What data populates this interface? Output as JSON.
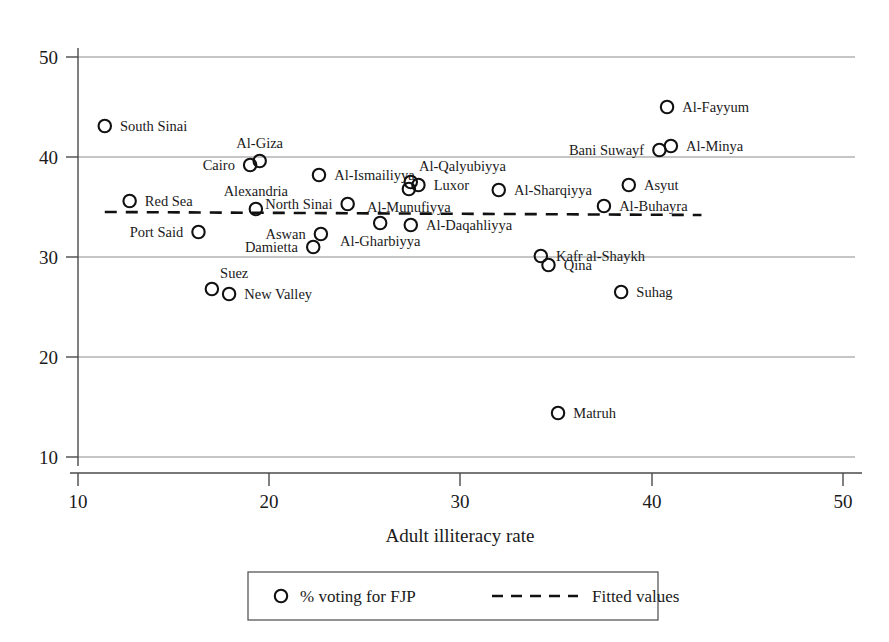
{
  "chart_data": {
    "type": "scatter",
    "title": "",
    "xlabel": "Adult illiteracy rate",
    "ylabel": "",
    "xlim": [
      10,
      50
    ],
    "ylim": [
      10,
      50
    ],
    "xticks": [
      10,
      20,
      30,
      40,
      50
    ],
    "yticks": [
      10,
      20,
      30,
      40,
      50
    ],
    "grid": true,
    "legend_position": "bottom",
    "legend": [
      {
        "label": "% voting for FJP",
        "marker": "circle"
      },
      {
        "label": "Fitted values",
        "marker": "dashed-line"
      }
    ],
    "series": [
      {
        "name": "% voting for FJP",
        "points": [
          {
            "label": "South Sinai",
            "x": 11.4,
            "y": 43.1,
            "label_pos": "right"
          },
          {
            "label": "Red Sea",
            "x": 12.7,
            "y": 35.6,
            "label_pos": "right"
          },
          {
            "label": "Port Said",
            "x": 16.3,
            "y": 32.5,
            "label_pos": "left"
          },
          {
            "label": "Suez",
            "x": 17.0,
            "y": 26.8,
            "label_pos": "above-right"
          },
          {
            "label": "New Valley",
            "x": 17.9,
            "y": 26.3,
            "label_pos": "right"
          },
          {
            "label": "Alexandria",
            "x": 19.3,
            "y": 34.8,
            "label_pos": "above"
          },
          {
            "label": "Cairo",
            "x": 19.0,
            "y": 39.2,
            "label_pos": "left"
          },
          {
            "label": "Al-Giza",
            "x": 19.5,
            "y": 39.6,
            "label_pos": "above"
          },
          {
            "label": "Damietta",
            "x": 22.3,
            "y": 31.0,
            "label_pos": "left"
          },
          {
            "label": "Aswan",
            "x": 22.7,
            "y": 32.3,
            "label_pos": "left"
          },
          {
            "label": "Al-Ismailiyya",
            "x": 22.6,
            "y": 38.2,
            "label_pos": "right"
          },
          {
            "label": "North Sinai",
            "x": 24.1,
            "y": 35.3,
            "label_pos": "left"
          },
          {
            "label": "Al-Gharbiyya",
            "x": 25.8,
            "y": 33.4,
            "label_pos": "below"
          },
          {
            "label": "Al-Daqahliyya",
            "x": 27.4,
            "y": 33.2,
            "label_pos": "right"
          },
          {
            "label": "Al-Qalyubiyya",
            "x": 27.4,
            "y": 37.5,
            "label_pos": "above-right"
          },
          {
            "label": "Luxor",
            "x": 27.8,
            "y": 37.2,
            "label_pos": "right"
          },
          {
            "label": "Al-Munufiyya",
            "x": 27.3,
            "y": 36.8,
            "label_pos": "below"
          },
          {
            "label": "Al-Sharqiyya",
            "x": 32.0,
            "y": 36.7,
            "label_pos": "right"
          },
          {
            "label": "Matruh",
            "x": 35.1,
            "y": 14.4,
            "label_pos": "right"
          },
          {
            "label": "Kafr al-Shaykh",
            "x": 34.2,
            "y": 30.1,
            "label_pos": "right"
          },
          {
            "label": "Qina",
            "x": 34.6,
            "y": 29.2,
            "label_pos": "right"
          },
          {
            "label": "Al-Buhayra",
            "x": 37.5,
            "y": 35.1,
            "label_pos": "right"
          },
          {
            "label": "Suhag",
            "x": 38.4,
            "y": 26.5,
            "label_pos": "right"
          },
          {
            "label": "Asyut",
            "x": 38.8,
            "y": 37.2,
            "label_pos": "right"
          },
          {
            "label": "Bani Suwayf",
            "x": 40.4,
            "y": 40.7,
            "label_pos": "left"
          },
          {
            "label": "Al-Minya",
            "x": 41.0,
            "y": 41.1,
            "label_pos": "right"
          },
          {
            "label": "Al-Fayyum",
            "x": 40.8,
            "y": 45.0,
            "label_pos": "right"
          }
        ]
      }
    ],
    "fit_line": {
      "name": "Fitted values",
      "x0": 11.4,
      "y0": 34.5,
      "x1": 42.6,
      "y1": 34.2,
      "style": "dashed"
    }
  }
}
